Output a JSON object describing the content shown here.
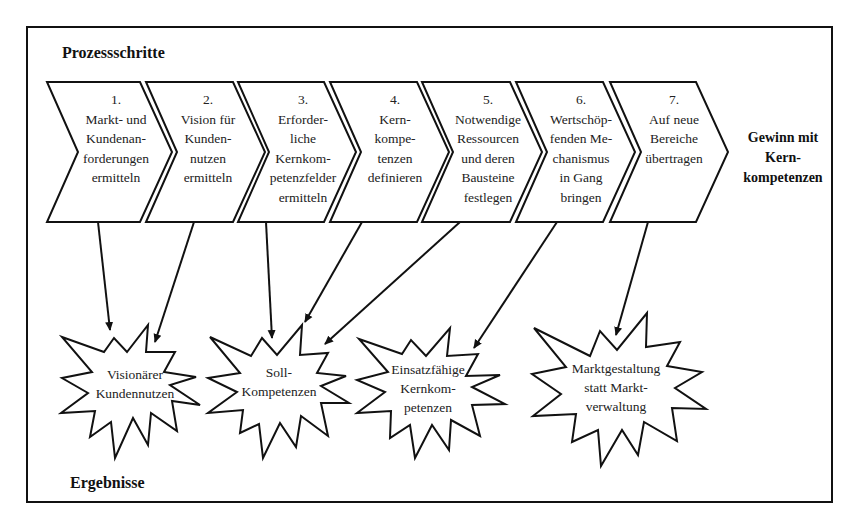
{
  "headings": {
    "process": "Prozessschritte",
    "results": "Ergebnisse"
  },
  "steps": [
    {
      "number": "1.",
      "lines": [
        "Markt- und",
        "Kundenan-",
        "forderungen",
        "ermitteln"
      ]
    },
    {
      "number": "2.",
      "lines": [
        "Vision für",
        "Kunden-",
        "nutzen",
        "ermitteln"
      ]
    },
    {
      "number": "3.",
      "lines": [
        "Erforder-",
        "liche",
        "Kernkom-",
        "petenzfelder",
        "ermitteln"
      ]
    },
    {
      "number": "4.",
      "lines": [
        "Kern-",
        "kompe-",
        "tenzen",
        "definieren"
      ]
    },
    {
      "number": "5.",
      "lines": [
        "Notwendige",
        "Ressourcen",
        "und deren",
        "Bausteine",
        "festlegen"
      ]
    },
    {
      "number": "6.",
      "lines": [
        "Wertschöp-",
        "fenden Me-",
        "chanismus",
        "in Gang",
        "bringen"
      ]
    },
    {
      "number": "7.",
      "lines": [
        "Auf neue",
        "Bereiche",
        "übertragen"
      ]
    }
  ],
  "outcome": {
    "lines": [
      "Gewinn mit",
      "Kern-",
      "kompetenzen"
    ]
  },
  "results": [
    {
      "lines": [
        "Visionärer",
        "Kundennutzen"
      ]
    },
    {
      "lines": [
        "Soll-",
        "Kompetenzen"
      ]
    },
    {
      "lines": [
        "Einsatzfähige",
        "Kernkom-",
        "petenzen"
      ]
    },
    {
      "lines": [
        "Marktgestaltung",
        "statt Markt-",
        "verwaltung"
      ]
    }
  ],
  "connections": [
    {
      "from_step": 1,
      "to_result": 1
    },
    {
      "from_step": 2,
      "to_result": 1
    },
    {
      "from_step": 3,
      "to_result": 2
    },
    {
      "from_step": 4,
      "to_result": 2
    },
    {
      "from_step": 5,
      "to_result": 2
    },
    {
      "from_step": 6,
      "to_result": 3
    },
    {
      "from_step": 7,
      "to_result": 4
    }
  ],
  "colors": {
    "stroke": "#111111",
    "text": "#222222",
    "background": "#ffffff"
  }
}
